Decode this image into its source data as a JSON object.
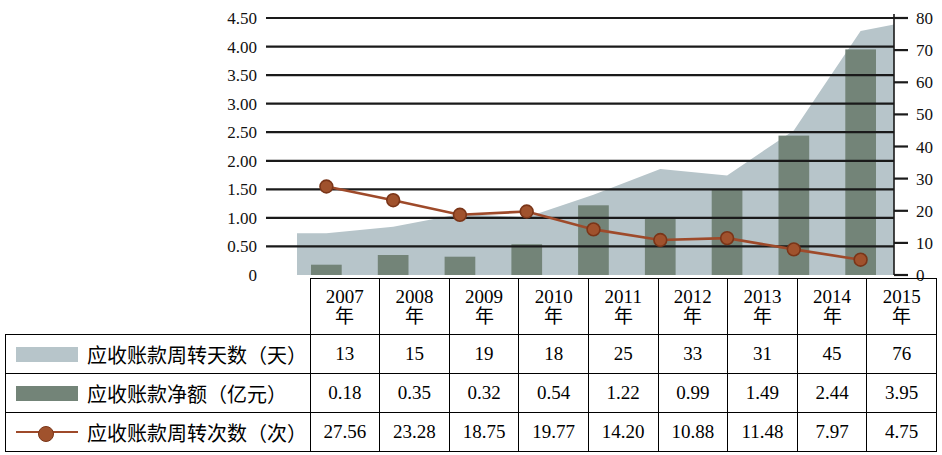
{
  "chart_data": {
    "type": "area",
    "title": "",
    "xlabel": "",
    "categories": [
      "2007年",
      "2008年",
      "2009年",
      "2010年",
      "2011年",
      "2012年",
      "2013年",
      "2014年",
      "2015年"
    ],
    "category_years": [
      "2007",
      "2008",
      "2009",
      "2010",
      "2011",
      "2012",
      "2013",
      "2014",
      "2015"
    ],
    "category_suffix": "年",
    "grid": true,
    "legend_position": "table-left-column",
    "axes": {
      "left": {
        "label": "",
        "ticks": [
          "0",
          "0.50",
          "1.00",
          "1.50",
          "2.00",
          "2.50",
          "3.00",
          "3.50",
          "4.00",
          "4.50"
        ],
        "min": 0,
        "max": 4.5,
        "step": 0.5
      },
      "right": {
        "label": "",
        "ticks": [
          "0",
          "10",
          "20",
          "30",
          "40",
          "50",
          "60",
          "70",
          "80"
        ],
        "min": 0,
        "max": 80,
        "step": 10
      }
    },
    "series": [
      {
        "name": "应收账款周转天数（天）",
        "unit": "天",
        "type": "area",
        "axis": "right",
        "color": "#b7c5ca",
        "values": [
          13,
          15,
          19,
          18,
          25,
          33,
          31,
          45,
          76
        ]
      },
      {
        "name": "应收账款净额（亿元）",
        "unit": "亿元",
        "type": "bar",
        "axis": "left",
        "color": "#738478",
        "values": [
          0.18,
          0.35,
          0.32,
          0.54,
          1.22,
          0.99,
          1.49,
          2.44,
          3.95
        ]
      },
      {
        "name": "应收账款周转次数（次）",
        "unit": "次",
        "type": "line",
        "axis": "right",
        "color": "#9e4a2a",
        "values": [
          27.56,
          23.28,
          18.75,
          19.77,
          14.2,
          10.88,
          11.48,
          7.97,
          4.75
        ]
      }
    ]
  },
  "table": {
    "rows": [
      {
        "label": "应收账款周转天数（天）",
        "swatch": "area-swatch",
        "values": [
          "13",
          "15",
          "19",
          "18",
          "25",
          "33",
          "31",
          "45",
          "76"
        ]
      },
      {
        "label": "应收账款净额（亿元）",
        "swatch": "bar-swatch",
        "values": [
          "0.18",
          "0.35",
          "0.32",
          "0.54",
          "1.22",
          "0.99",
          "1.49",
          "2.44",
          "3.95"
        ]
      },
      {
        "label": "应收账款周转次数（次）",
        "swatch": "line-swatch",
        "values": [
          "27.56",
          "23.28",
          "18.75",
          "19.77",
          "14.20",
          "10.88",
          "11.48",
          "7.97",
          "4.75"
        ]
      }
    ]
  },
  "colors": {
    "area": "#b7c5ca",
    "bar": "#738478",
    "line": "#9e4a2a",
    "marker": "#a0522d",
    "grid": "#1a1a1a",
    "text": "#111111"
  }
}
